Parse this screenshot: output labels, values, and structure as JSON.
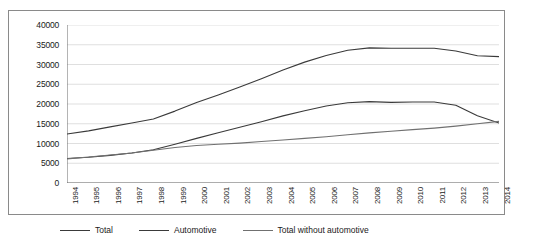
{
  "chart_data": {
    "type": "line",
    "title": "",
    "xlabel": "",
    "ylabel": "",
    "ylim": [
      0,
      40000
    ],
    "ytick_step": 5000,
    "grid": true,
    "legend_position": "bottom",
    "yticks": [
      "0",
      "5000",
      "10000",
      "15000",
      "20000",
      "25000",
      "30000",
      "35000",
      "40000"
    ],
    "categories": [
      "1994",
      "1995",
      "1996",
      "1997",
      "1998",
      "1999",
      "2000",
      "2001",
      "2002",
      "2003",
      "2004",
      "2005",
      "2006",
      "2007",
      "2008",
      "2009",
      "2010",
      "2011",
      "2012",
      "2013",
      "2014"
    ],
    "series": [
      {
        "name": "Total",
        "color": "#3a3a3a",
        "values": [
          12400,
          13200,
          14200,
          15200,
          16200,
          18200,
          20400,
          22300,
          24300,
          26400,
          28600,
          30600,
          32300,
          33600,
          34200,
          34100,
          34100,
          34100,
          33400,
          32200,
          32000
        ]
      },
      {
        "name": "Automotive",
        "color": "#3a3a3a",
        "values": [
          6200,
          6500,
          7000,
          7600,
          8400,
          9800,
          11300,
          12700,
          14100,
          15500,
          17000,
          18300,
          19500,
          20300,
          20600,
          20400,
          20500,
          20500,
          19700,
          17000,
          15200
        ]
      },
      {
        "name": "Total without automotive",
        "color": "#707070",
        "values": [
          6100,
          6600,
          7100,
          7600,
          8300,
          9000,
          9500,
          9800,
          10100,
          10500,
          10900,
          11300,
          11700,
          12200,
          12700,
          13100,
          13500,
          13900,
          14400,
          15000,
          15600
        ]
      }
    ]
  },
  "legend": {
    "items": [
      {
        "label": "Total"
      },
      {
        "label": "Automotive"
      },
      {
        "label": "Total without automotive"
      }
    ]
  }
}
